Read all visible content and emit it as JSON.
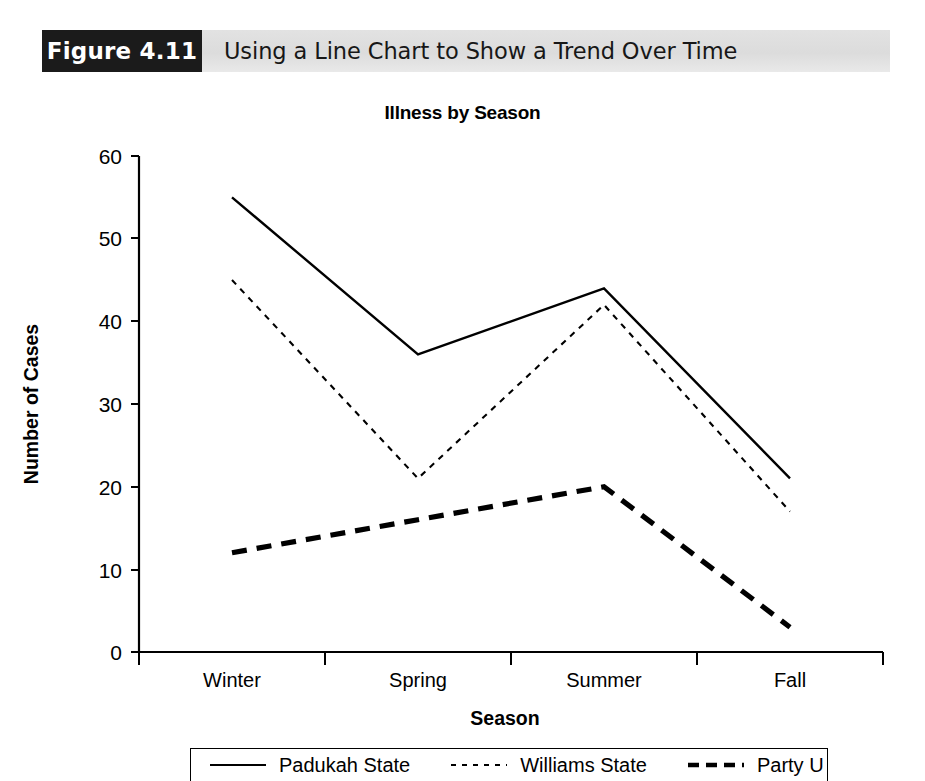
{
  "caption": {
    "figure_number": "Figure 4.11",
    "title": "Using a Line Chart to Show a Trend Over Time"
  },
  "chart_data": {
    "type": "line",
    "title": "Illness by Season",
    "xlabel": "Season",
    "ylabel": "Number of Cases",
    "categories": [
      "Winter",
      "Spring",
      "Summer",
      "Fall"
    ],
    "ylim": [
      0,
      60
    ],
    "yticks": [
      "0",
      "10",
      "20",
      "30",
      "40",
      "50",
      "60"
    ],
    "grid": false,
    "legend_position": "bottom",
    "series": [
      {
        "name": "Padukah State",
        "style": "solid",
        "values": [
          55,
          36,
          44,
          21
        ]
      },
      {
        "name": "Williams State",
        "style": "dotted",
        "values": [
          45,
          21,
          42,
          17
        ]
      },
      {
        "name": "Party U",
        "style": "dashed-thick",
        "values": [
          12,
          16,
          20,
          3
        ]
      }
    ]
  },
  "colors": {
    "caption_bar": "#dcdcdc",
    "figure_box": "#1b1b1b",
    "line": "#000000",
    "text": "#000000"
  }
}
